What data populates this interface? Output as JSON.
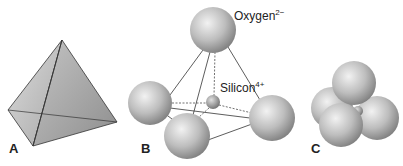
{
  "figure": {
    "panels": [
      {
        "id": "A",
        "label": "A",
        "description": "Tetrahedron geometric shape"
      },
      {
        "id": "B",
        "label": "B",
        "description": "Ball-and-stick model with four oxygen ions around a central silicon ion"
      },
      {
        "id": "C",
        "label": "C",
        "description": "Space-filling model of four oxygen ions"
      }
    ],
    "annotations": {
      "oxygen": {
        "name": "Oxygen",
        "charge": "2−"
      },
      "silicon": {
        "name": "Silicon",
        "charge": "4+"
      }
    }
  },
  "colors": {
    "sphere_light": "#e6e6e6",
    "sphere_dark": "#8a8a8a",
    "edge": "#333333",
    "face_light": "#d9d9d9",
    "face_dark": "#9c9c9c"
  }
}
